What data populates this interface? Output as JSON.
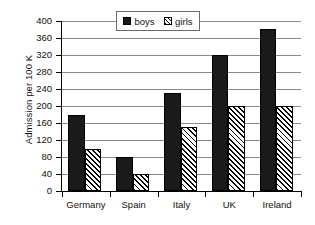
{
  "chart_data": {
    "type": "bar",
    "title": "",
    "subtitle": "",
    "xlabel": "",
    "ylabel": "Admission per 100 K",
    "categories": [
      "Germany",
      "Spain",
      "Italy",
      "UK",
      "Ireland"
    ],
    "series": [
      {
        "name": "boys",
        "values": [
          180,
          80,
          230,
          320,
          382
        ],
        "color": "#1a1a1a",
        "fill": "solid"
      },
      {
        "name": "girls",
        "values": [
          100,
          40,
          150,
          200,
          200
        ],
        "color": "#ffffff",
        "fill": "diagonal-hatch"
      }
    ],
    "ylim": [
      0,
      400
    ],
    "ytick_step": 40,
    "yticks": [
      0,
      40,
      80,
      120,
      160,
      200,
      240,
      280,
      320,
      360,
      400
    ],
    "ytick_labels": [
      "0",
      "40",
      "80",
      "120",
      "160",
      "200",
      "240",
      "280",
      "320",
      "360",
      "400"
    ],
    "grid": "horizontal",
    "legend_position": "top-center",
    "legend_entries": [
      "boys",
      "girls"
    ],
    "annotations": []
  },
  "legend": {
    "entries": [
      {
        "label": "boys",
        "swatch": "solid-black-square-icon"
      },
      {
        "label": "girls",
        "swatch": "hatched-square-icon"
      }
    ]
  },
  "colors": {
    "background": "#ffffff",
    "axis": "#000000",
    "gridline": "#8c8c8c",
    "boys": "#1a1a1a",
    "girls": "#ffffff",
    "text": "#111111",
    "legend_border": "#6b6b6b"
  }
}
